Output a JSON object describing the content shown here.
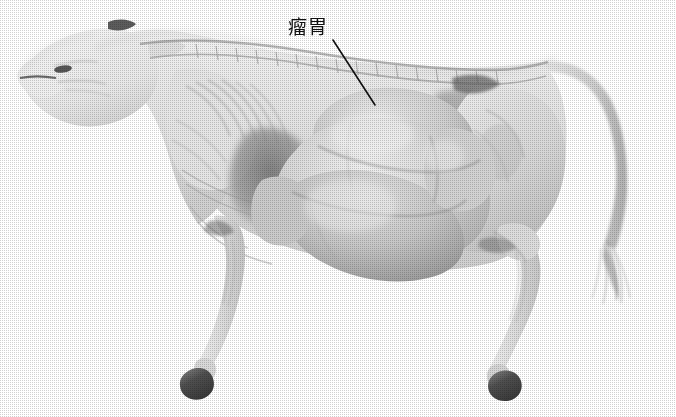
{
  "figure": {
    "kind": "anatomical-photograph",
    "orientation": "left lateral view, head to the left",
    "background_color": "#ffffff",
    "ink_color": "#111111",
    "width": 676,
    "height": 417
  },
  "annotations": [
    {
      "id": "rumen",
      "label": "瘤胃",
      "text_x": 288,
      "text_y": 18,
      "leader": {
        "x1": 333,
        "y1": 40,
        "x2": 375,
        "y2": 105,
        "width": 1.6,
        "color": "#111111"
      }
    }
  ],
  "structures": [
    {
      "name": "head",
      "tone": "#e6e6e6"
    },
    {
      "name": "muzzle",
      "tone": "#ededed"
    },
    {
      "name": "eye-socket",
      "tone": "#3a3a3a"
    },
    {
      "name": "horn-base",
      "tone": "#4a4a4a"
    },
    {
      "name": "neck",
      "tone": "#e2e2e2"
    },
    {
      "name": "cervical-vertebrae",
      "tone": "#cfcfcf"
    },
    {
      "name": "scapula",
      "tone": "#dedede"
    },
    {
      "name": "rib-cage",
      "tone": "#d8d8d8"
    },
    {
      "name": "thoracic-spine",
      "tone": "#cdcdcd"
    },
    {
      "name": "lumbar-spine",
      "tone": "#d2d2d2"
    },
    {
      "name": "rumen",
      "tone": "#d4d4d4"
    },
    {
      "name": "rumen-dorsal-sac",
      "tone": "#dcdcdc"
    },
    {
      "name": "rumen-ventral-sac",
      "tone": "#c9c9c9"
    },
    {
      "name": "reticulum",
      "tone": "#cacaca"
    },
    {
      "name": "abdominal-shadow",
      "tone": "#6e6e6e"
    },
    {
      "name": "hip-thigh",
      "tone": "#d6d6d6"
    },
    {
      "name": "forelimb",
      "tone": "#e4e4e4"
    },
    {
      "name": "hindlimb",
      "tone": "#e0e0e0"
    },
    {
      "name": "front-hoof",
      "tone": "#555555"
    },
    {
      "name": "hind-hoof",
      "tone": "#505050"
    },
    {
      "name": "tail",
      "tone": "#cfcfcf"
    },
    {
      "name": "tail-switch",
      "tone": "#bdbdbd"
    }
  ]
}
